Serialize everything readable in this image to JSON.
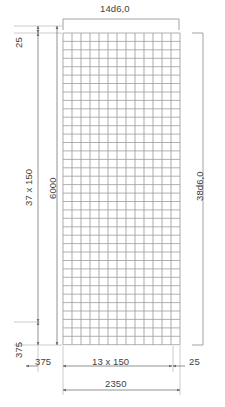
{
  "drawing": {
    "type": "reinforcement-mesh-detail",
    "title_top": "14d6,0",
    "labels": {
      "top_count_diameter": "14d6,0",
      "right_count_diameter": "38d6,0",
      "left_top_edge_cover": "25",
      "left_spacing_run": "37 x 150",
      "left_overall_length": "6000",
      "left_bottom_cover": "375",
      "bottom_left_edge": "375",
      "bottom_spacing_run": "13 x 150",
      "bottom_right_edge": "25",
      "bottom_overall_width": "2350"
    },
    "mesh": {
      "vertical_bar_count": 14,
      "horizontal_bar_count": 38,
      "bar_diameter": "6,0",
      "vertical_spacing": 150,
      "horizontal_spacing": 150,
      "panel_width": 2350,
      "panel_length": 6000
    },
    "colors": {
      "line": "#8c8c8c",
      "bar": "#9a9a9a",
      "text": "#3f3f3f",
      "background": "#ffffff"
    }
  }
}
